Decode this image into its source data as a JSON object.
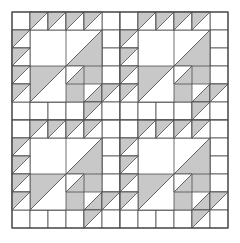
{
  "figure": {
    "type": "quilt-pattern-diagram",
    "width": 240,
    "height": 243,
    "background_color": "#ffffff"
  },
  "colors": {
    "fabric_light": "#ffffff",
    "fabric_gray": "#c8c8c8",
    "outline": "#4d4d4d",
    "outline_width": 0.8
  },
  "grid": {
    "origin_x": 12,
    "origin_y": 12,
    "cell_size": 18,
    "block_cells": 6,
    "blocks_across": 2,
    "blocks_down": 2,
    "total_cells": 12,
    "total_size": 216
  },
  "block": {
    "name": "birds-in-the-air-corner-block",
    "description": "Six by six grid: top row and left column of half-square triangles, a large white quarter triangle in the inner four by four area, and nested half-square triangle units filling the lower-right diagonal.",
    "hst_top_row": [
      {
        "col": 1,
        "row": 0,
        "orientation": "tl"
      },
      {
        "col": 2,
        "row": 0,
        "orientation": "tl"
      },
      {
        "col": 3,
        "row": 0,
        "orientation": "tl"
      },
      {
        "col": 4,
        "row": 0,
        "orientation": "tl"
      }
    ],
    "hst_left_col": [
      {
        "col": 0,
        "row": 1,
        "orientation": "tl"
      },
      {
        "col": 0,
        "row": 2,
        "orientation": "tl"
      },
      {
        "col": 0,
        "row": 3,
        "orientation": "tl"
      },
      {
        "col": 0,
        "row": 4,
        "orientation": "tl"
      }
    ],
    "large_triangle": {
      "x0": 1,
      "y0": 1,
      "size": 4,
      "fill": "fabric_light",
      "hypotenuse": "tl-to-br"
    },
    "big_gray_triangle": {
      "x0": 1,
      "y0": 1,
      "size": 4,
      "fill": "fabric_gray",
      "note": "lower-right half of the inner four by four square"
    },
    "nested_units": [
      {
        "x0": 3,
        "y0": 1,
        "size": 2,
        "white_corner": "tr"
      },
      {
        "x0": 1,
        "y0": 3,
        "size": 2,
        "white_corner": "bl"
      },
      {
        "x0": 3,
        "y0": 3,
        "size": 1,
        "white_corner": "tr"
      },
      {
        "x0": 4,
        "y0": 4,
        "size": 1,
        "white_corner": "tr"
      }
    ],
    "corner_gray_cells": [
      {
        "col": 5,
        "row": 4,
        "orientation": "tl-gray-point-right"
      }
    ],
    "plain_cells": [
      {
        "col": 0,
        "row": 0
      },
      {
        "col": 5,
        "row": 0
      },
      {
        "col": 0,
        "row": 5
      },
      {
        "col": 1,
        "row": 5
      },
      {
        "col": 2,
        "row": 5
      },
      {
        "col": 3,
        "row": 5
      },
      {
        "col": 5,
        "row": 1
      },
      {
        "col": 5,
        "row": 2
      },
      {
        "col": 5,
        "row": 3
      }
    ]
  },
  "layout": {
    "blocks": [
      {
        "index": 0,
        "row": 0,
        "col": 0,
        "name": "block-top-left"
      },
      {
        "index": 1,
        "row": 0,
        "col": 1,
        "name": "block-top-right"
      },
      {
        "index": 2,
        "row": 1,
        "col": 0,
        "name": "block-bottom-left"
      },
      {
        "index": 3,
        "row": 1,
        "col": 1,
        "name": "block-bottom-right"
      }
    ]
  }
}
